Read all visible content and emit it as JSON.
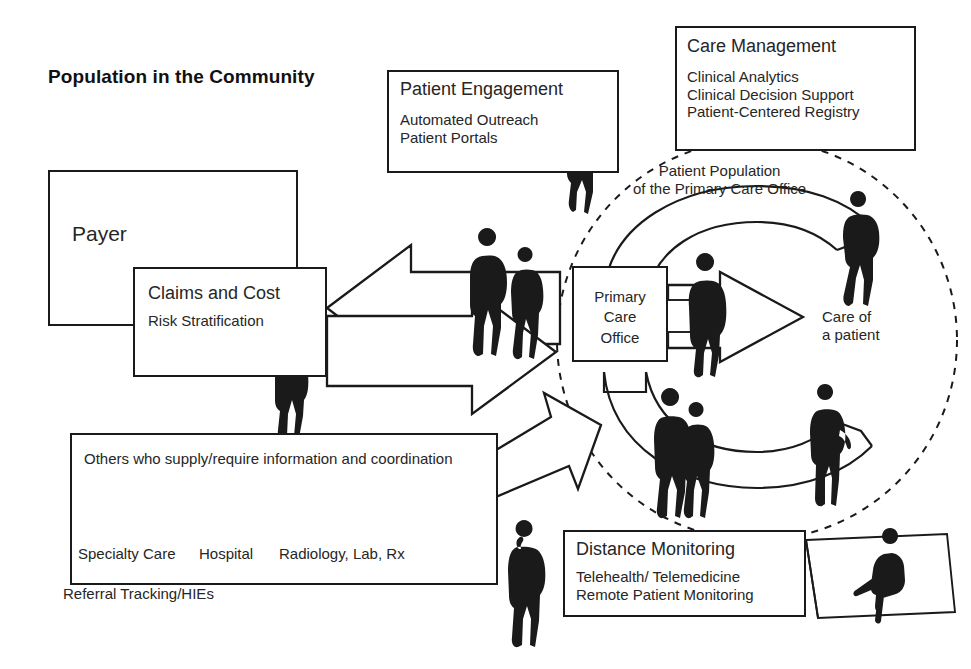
{
  "diagram": {
    "title": "Population in the Community",
    "boxes": {
      "payer": {
        "label": "Payer"
      },
      "claims": {
        "title": "Claims and Cost",
        "subtitle": "Risk Stratification"
      },
      "patient_engagement": {
        "title": "Patient Engagement",
        "lines": "Automated Outreach\nPatient Portals"
      },
      "care_management": {
        "title": "Care Management",
        "lines": "Clinical Analytics\nClinical Decision Support\nPatient-Centered Registry"
      },
      "primary_care_office": {
        "label": "Primary\nCare\nOffice"
      },
      "others": {
        "title": "Others who supply/require information and coordination",
        "footer": "Referral Tracking/HIEs",
        "items": [
          {
            "icon": "stethoscope-icon",
            "caption": "Specialty Care"
          },
          {
            "icon": "hospital-cross-icon",
            "caption": "Hospital"
          },
          {
            "icon": "lab-flask-icon",
            "caption": "Radiology, Lab, Rx"
          },
          {
            "icon": "pills-icon",
            "caption": ""
          }
        ]
      },
      "distance_monitoring": {
        "title": "Distance Monitoring",
        "lines": "Telehealth/ Telemedicine\nRemote Patient Monitoring"
      }
    },
    "captions": {
      "patient_population": "Patient Population\nof the Primary Care Office",
      "care_of_a_patient": "Care of\na patient"
    },
    "colors": {
      "ink": "#1a1a1a",
      "text": "#262626",
      "background": "#ffffff"
    }
  }
}
